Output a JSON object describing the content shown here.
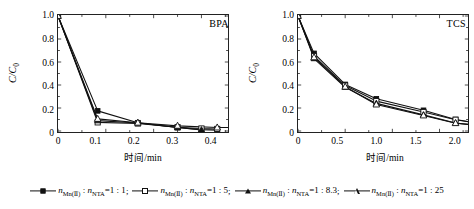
{
  "chart_data": [
    {
      "type": "line",
      "title": "BPA",
      "xlabel": "时间/min",
      "ylabel": "C/C0",
      "xlim": [
        0,
        0.4
      ],
      "ylim": [
        0,
        1.0
      ],
      "xticks": [
        "0",
        "0.1",
        "0.2",
        "0.3",
        "0.4"
      ],
      "xtick_values": [
        0,
        0.1,
        0.2,
        0.3,
        0.4
      ],
      "yticks": [
        "0",
        "0.2",
        "0.4",
        "0.6",
        "0.8",
        "1.0"
      ],
      "ytick_values": [
        0,
        0.2,
        0.4,
        0.6,
        0.8,
        1.0
      ],
      "grid": false,
      "legend_position": "below-figure",
      "series": [
        {
          "name": "nMn(II) : nNTA=1 : 1",
          "marker": "filled-square",
          "x": [
            0,
            0.083,
            0.167,
            0.25,
            0.3,
            0.333
          ],
          "y": [
            1.0,
            0.175,
            0.072,
            0.03,
            0.012,
            0.008
          ]
        },
        {
          "name": "nMn(II) : nNTA=1 : 5",
          "marker": "open-square",
          "x": [
            0,
            0.083,
            0.167,
            0.25,
            0.3,
            0.333
          ],
          "y": [
            1.0,
            0.075,
            0.065,
            0.033,
            0.022,
            0.018
          ]
        },
        {
          "name": "nMn(II) : nNTA=1 : 8.3",
          "marker": "filled-triangle",
          "x": [
            0,
            0.083,
            0.167,
            0.25,
            0.3
          ],
          "y": [
            1.0,
            0.09,
            0.07,
            0.03,
            0.01
          ]
        },
        {
          "name": "nMn(II) : nNTA=1 : 25",
          "marker": "open-triangle",
          "x": [
            0,
            0.083,
            0.167,
            0.25,
            0.333,
            0.417
          ],
          "y": [
            1.0,
            0.105,
            0.072,
            0.045,
            0.03,
            0.03
          ]
        }
      ]
    },
    {
      "type": "line",
      "title": "TCS",
      "xlabel": "时间/min",
      "ylabel": "C/C0",
      "xlim": [
        0,
        2.0
      ],
      "ylim": [
        0,
        1.0
      ],
      "xticks": [
        "0",
        "0.5",
        "1.0",
        "1.5",
        "2.0"
      ],
      "xtick_values": [
        0,
        0.5,
        1.0,
        1.5,
        2.0
      ],
      "yticks": [
        "0",
        "0.2",
        "0.4",
        "0.6",
        "0.8",
        "1.0"
      ],
      "ytick_values": [
        0,
        0.2,
        0.4,
        0.6,
        0.8,
        1.0
      ],
      "grid": false,
      "legend_position": "below-figure",
      "series": [
        {
          "name": "nMn(II) : nNTA=1 : 1",
          "marker": "filled-square",
          "x": [
            0,
            0.17,
            0.5,
            0.83,
            1.33,
            1.67,
            2.0
          ],
          "y": [
            1.0,
            0.675,
            0.405,
            0.28,
            0.18,
            0.1,
            0.055
          ]
        },
        {
          "name": "nMn(II) : nNTA=1 : 5",
          "marker": "open-square",
          "x": [
            0,
            0.17,
            0.5,
            0.83,
            1.33,
            1.67,
            2.0
          ],
          "y": [
            1.0,
            0.65,
            0.395,
            0.26,
            0.165,
            0.098,
            0.055
          ]
        },
        {
          "name": "nMn(II) : nNTA=1 : 8.3",
          "marker": "filled-triangle",
          "x": [
            0,
            0.17,
            0.5,
            0.83,
            1.33,
            1.67,
            2.0
          ],
          "y": [
            1.0,
            0.63,
            0.38,
            0.24,
            0.14,
            0.07,
            0.04
          ]
        },
        {
          "name": "nMn(II) : nNTA=1 : 25",
          "marker": "open-triangle",
          "x": [
            0,
            0.17,
            0.5,
            0.83,
            1.33,
            1.67,
            2.0
          ],
          "y": [
            1.0,
            0.64,
            0.385,
            0.23,
            0.135,
            0.068,
            0.042
          ]
        }
      ]
    }
  ],
  "panels": {
    "left": {
      "tag": "BPA",
      "xlabel": "时间/min",
      "xticks": [
        "0",
        "0.1",
        "0.2",
        "0.3",
        "0.4"
      ],
      "yticks": [
        "1.0",
        "0.8",
        "0.6",
        "0.4",
        "0.2",
        "0"
      ]
    },
    "right": {
      "tag": "TCS",
      "xlabel": "时间/min",
      "xticks": [
        "0",
        "0.5",
        "1.0",
        "1.5",
        "2.0"
      ],
      "yticks": [
        "1.0",
        "0.8",
        "0.6",
        "0.4",
        "0.2",
        "0"
      ]
    }
  },
  "legend": {
    "items": [
      {
        "marker": "filled-square",
        "ratio": "1 : 1",
        "sep": ";"
      },
      {
        "marker": "open-square",
        "ratio": "1 : 5",
        "sep": ";"
      },
      {
        "marker": "filled-triangle",
        "ratio": "1 : 8.3",
        "sep": ";"
      },
      {
        "marker": "open-triangle",
        "ratio": "1 : 25",
        "sep": ""
      }
    ],
    "species_main": "n",
    "species_sub_mn": "Mn(Ⅱ)",
    "species_sub_nta": "NTA",
    "colon": " : ",
    "equals": "="
  },
  "colors": {
    "line": "#111111",
    "axis": "#222222",
    "background": "#ffffff"
  }
}
